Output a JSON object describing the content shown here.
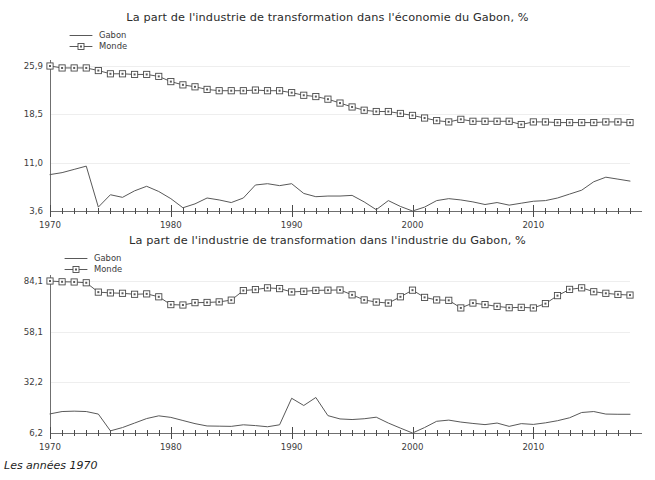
{
  "caption": "Les années 1970",
  "panels": [
    {
      "id": "top",
      "title": "La part de l'industrie de transformation dans l'économie du Gabon, %",
      "legend": [
        {
          "label": "Gabon",
          "style": "line"
        },
        {
          "label": "Monde",
          "style": "line-marker"
        }
      ]
    },
    {
      "id": "bottom",
      "title": "La part de l'industrie de transformation dans l'industrie du Gabon, %",
      "legend": [
        {
          "label": "Gabon",
          "style": "line"
        },
        {
          "label": "Monde",
          "style": "line-marker"
        }
      ]
    }
  ],
  "chart_data": [
    {
      "type": "line",
      "title": "La part de l'industrie de transformation dans l'économie du Gabon, %",
      "xlabel": "",
      "ylabel": "",
      "grid": true,
      "legend_position": "top-left",
      "xlim": [
        1970,
        2018
      ],
      "ylim": [
        3.6,
        25.9
      ],
      "yticks": [
        3.6,
        11.0,
        18.5,
        25.9
      ],
      "ytick_labels": [
        "3,6",
        "11,0",
        "18,5",
        "25,9"
      ],
      "xticks": [
        1970,
        1980,
        1990,
        2000,
        2010
      ],
      "xtick_labels": [
        "1970",
        "1980",
        "1990",
        "2000",
        "2010"
      ],
      "x": [
        1970,
        1971,
        1972,
        1973,
        1974,
        1975,
        1976,
        1977,
        1978,
        1979,
        1980,
        1981,
        1982,
        1983,
        1984,
        1985,
        1986,
        1987,
        1988,
        1989,
        1990,
        1991,
        1992,
        1993,
        1994,
        1995,
        1996,
        1997,
        1998,
        1999,
        2000,
        2001,
        2002,
        2003,
        2004,
        2005,
        2006,
        2007,
        2008,
        2009,
        2010,
        2011,
        2012,
        2013,
        2014,
        2015,
        2016,
        2017,
        2018
      ],
      "series": [
        {
          "name": "Monde",
          "marker": "square",
          "values": [
            25.9,
            25.6,
            25.6,
            25.6,
            25.2,
            24.7,
            24.7,
            24.6,
            24.6,
            24.3,
            23.5,
            23.0,
            22.7,
            22.3,
            22.1,
            22.1,
            22.1,
            22.2,
            22.1,
            22.1,
            21.8,
            21.4,
            21.2,
            20.8,
            20.2,
            19.6,
            19.1,
            18.9,
            18.9,
            18.6,
            18.3,
            17.9,
            17.5,
            17.3,
            17.7,
            17.4,
            17.4,
            17.4,
            17.4,
            16.9,
            17.3,
            17.3,
            17.2,
            17.2,
            17.2,
            17.2,
            17.3,
            17.3,
            17.2
          ]
        },
        {
          "name": "Gabon",
          "marker": "none",
          "values": [
            9.2,
            9.5,
            10.0,
            10.5,
            4.2,
            6.1,
            5.7,
            6.7,
            7.4,
            6.6,
            5.5,
            4.1,
            4.7,
            5.6,
            5.3,
            4.9,
            5.6,
            7.6,
            7.8,
            7.5,
            7.8,
            6.3,
            5.8,
            5.9,
            5.9,
            6.0,
            5.0,
            3.8,
            5.2,
            4.3,
            3.6,
            4.2,
            5.2,
            5.5,
            5.3,
            5.0,
            4.6,
            4.9,
            4.5,
            4.8,
            5.1,
            5.2,
            5.6,
            6.2,
            6.8,
            8.1,
            8.8,
            8.5,
            8.2
          ]
        }
      ]
    },
    {
      "type": "line",
      "title": "La part de l'industrie de transformation dans l'industrie du Gabon, %",
      "xlabel": "",
      "ylabel": "",
      "grid": true,
      "legend_position": "top-left",
      "xlim": [
        1970,
        2018
      ],
      "ylim": [
        6.2,
        84.1
      ],
      "yticks": [
        6.2,
        32.2,
        58.1,
        84.1
      ],
      "ytick_labels": [
        "6,2",
        "32,2",
        "58,1",
        "84,1"
      ],
      "xticks": [
        1970,
        1980,
        1990,
        2000,
        2010
      ],
      "xtick_labels": [
        "1970",
        "1980",
        "1990",
        "2000",
        "2010"
      ],
      "x": [
        1970,
        1971,
        1972,
        1973,
        1974,
        1975,
        1976,
        1977,
        1978,
        1979,
        1980,
        1981,
        1982,
        1983,
        1984,
        1985,
        1986,
        1987,
        1988,
        1989,
        1990,
        1991,
        1992,
        1993,
        1994,
        1995,
        1996,
        1997,
        1998,
        1999,
        2000,
        2001,
        2002,
        2003,
        2004,
        2005,
        2006,
        2007,
        2008,
        2009,
        2010,
        2011,
        2012,
        2013,
        2014,
        2015,
        2016,
        2017,
        2018
      ],
      "series": [
        {
          "name": "Monde",
          "marker": "square",
          "values": [
            84.1,
            83.7,
            83.6,
            83.2,
            78.4,
            78.0,
            77.8,
            77.3,
            77.5,
            76.0,
            72.0,
            71.8,
            73.0,
            73.1,
            73.4,
            74.3,
            79.2,
            79.7,
            80.6,
            80.2,
            78.5,
            78.8,
            79.3,
            79.4,
            79.5,
            77.0,
            74.4,
            73.3,
            72.8,
            76.0,
            79.4,
            75.7,
            74.4,
            74.2,
            70.3,
            72.8,
            72.0,
            71.1,
            70.4,
            70.6,
            70.3,
            72.5,
            76.6,
            79.8,
            80.6,
            78.6,
            77.8,
            77.2,
            76.9
          ]
        },
        {
          "name": "Gabon",
          "marker": "none",
          "values": [
            16.0,
            17.2,
            17.4,
            17.2,
            15.9,
            7.3,
            9.0,
            11.3,
            13.6,
            15.0,
            14.2,
            12.6,
            11.0,
            9.8,
            9.7,
            9.6,
            10.4,
            10.0,
            9.4,
            10.4,
            24.0,
            20.3,
            24.4,
            15.1,
            13.4,
            13.1,
            13.5,
            14.3,
            11.3,
            8.7,
            6.2,
            9.0,
            12.2,
            12.8,
            11.8,
            11.1,
            10.5,
            11.3,
            9.6,
            11.0,
            10.6,
            11.4,
            12.5,
            14.0,
            16.7,
            17.2,
            15.9,
            15.8,
            15.8
          ]
        }
      ]
    }
  ]
}
